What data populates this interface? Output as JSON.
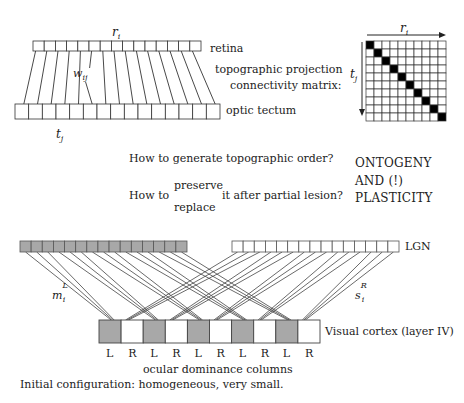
{
  "top_diagram": {
    "retina_label": "retina",
    "tectum_label": "optic tectum",
    "projection_label": "topographic projection",
    "matrix_label": "connectivity matrix:",
    "r_label": "r",
    "r_sub": "i",
    "t_label": "t",
    "t_sub": "j",
    "w_label": "w",
    "w_sub": "ij",
    "retina_cells": 15,
    "tectum_cells": 15,
    "matrix_size": 10,
    "matrix_r_label": "r",
    "matrix_r_sub": "i",
    "matrix_t_label": "t",
    "matrix_t_sub": "j"
  },
  "questions": {
    "q1": "How to generate topographic order?",
    "q2_prefix": "How to",
    "q2_option_top": "preserve",
    "q2_option_bottom": "replace",
    "q2_suffix": "it after partial lesion?"
  },
  "keywords": {
    "line1": "ONTOGENY",
    "line2": "AND (!)",
    "line3": "PLASTICITY"
  },
  "bottom_diagram": {
    "lgn_label": "LGN",
    "cortex_label": "Visual cortex (layer IV)",
    "m_label": "m",
    "m_sub": "i",
    "m_sup": "L",
    "s_label": "s",
    "s_sub": "i",
    "s_sup": "R",
    "lgn_left_cells": 15,
    "lgn_right_cells": 15,
    "cortex_columns": [
      "L",
      "R",
      "L",
      "R",
      "L",
      "R",
      "L",
      "R",
      "L",
      "R"
    ],
    "ocular_label": "ocular dominance columns",
    "colors": {
      "left_eye": "#a8a8a8",
      "right_eye": "#ffffff",
      "stroke": "#333333"
    }
  },
  "footer": {
    "caption": "Initial configuration: homogeneous, very small."
  }
}
